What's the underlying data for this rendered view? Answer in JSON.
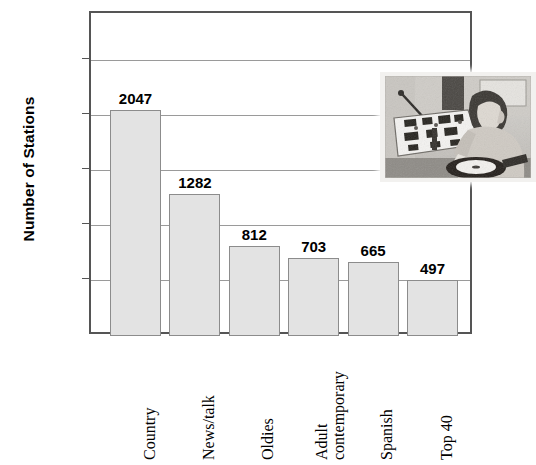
{
  "chart_data": {
    "type": "bar",
    "title": "",
    "subtitle": "",
    "xlabel": "",
    "ylabel": "Number of Stations",
    "categories": [
      "Country",
      "News/talk",
      "Oldies",
      "Adult contemporary",
      "Spanish",
      "Top 40"
    ],
    "values": [
      2047,
      1282,
      812,
      703,
      665,
      497
    ],
    "value_labels": [
      "2047",
      "1282",
      "812",
      "703",
      "665",
      "497"
    ],
    "ylim": [
      0,
      2750
    ],
    "yticks": [
      500,
      1000,
      1500,
      2000,
      2500
    ],
    "ytick_labels": [
      "500",
      "1000",
      "1500",
      "2000",
      "2500"
    ],
    "grid": true,
    "legend": "none",
    "bar_color": "#e3e3e3",
    "bar_border_color": "#8c8c8c",
    "axis_color": "#555555",
    "grid_color": "#9a9a9a",
    "text_color": "#000000",
    "annotations": [
      {
        "name": "inset-photo",
        "description": "Vintage black-and-white photograph of a radio disc jockey seated at a broadcast mixing console with a turntable"
      }
    ]
  },
  "category_label_lines": [
    [
      "Country"
    ],
    [
      "News/talk"
    ],
    [
      "Oldies"
    ],
    [
      "Adult",
      "contemporary"
    ],
    [
      "Spanish"
    ],
    [
      "Top 40"
    ]
  ]
}
